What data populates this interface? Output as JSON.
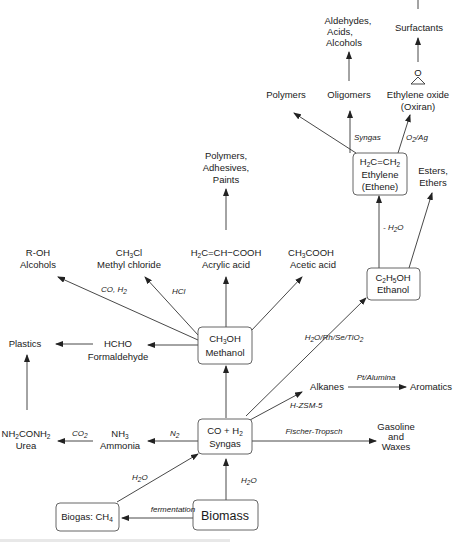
{
  "diagram": {
    "nodes": {
      "biomass": {
        "label": "Biomass"
      },
      "biogas": {
        "label": "Biogas: CH",
        "sub": "4"
      },
      "syngas": {
        "formula": "CO + H",
        "formula_sub": "2",
        "label": "Syngas"
      },
      "methanol": {
        "formula": "CH",
        "formula_sub": "3",
        "formula_rest": "OH",
        "label": "Methanol"
      },
      "ethanol": {
        "formula_a": "C",
        "sub_a": "2",
        "formula_b": "H",
        "sub_b": "5",
        "formula_rest": "OH",
        "label": "Ethanol"
      },
      "ethylene": {
        "formula_a": "H",
        "sub_a": "2",
        "formula_b": "C=CH",
        "sub_b": "2",
        "label": "Ethylene",
        "label2": "(Ethene)"
      },
      "ammonia": {
        "formula": "NH",
        "formula_sub": "3",
        "label": "Ammonia"
      },
      "urea": {
        "formula_a": "NH",
        "sub_a": "2",
        "formula_b": "CONH",
        "sub_b": "2",
        "label": "Urea"
      },
      "plastics": {
        "label": "Plastics"
      },
      "formaldehyde": {
        "formula": "HCHO",
        "label": "Formaldehyde"
      },
      "alcohols": {
        "formula": "R-OH",
        "label": "Alcohols"
      },
      "methyl_chloride": {
        "formula": "CH",
        "formula_sub": "3",
        "formula_rest": "Cl",
        "label": "Methyl chloride"
      },
      "acrylic_acid": {
        "formula_a": "H",
        "sub_a": "2",
        "formula_b": "C=CH−COOH",
        "label": "Acrylic acid"
      },
      "acetic_acid": {
        "formula": "CH",
        "formula_sub": "3",
        "formula_rest": "COOH",
        "label": "Acetic acid"
      },
      "polymers_adhesives": {
        "lines": [
          "Polymers,",
          "Adhesives,",
          "Paints"
        ]
      },
      "alkanes": {
        "label": "Alkanes"
      },
      "aromatics": {
        "label": "Aromatics"
      },
      "gasoline": {
        "lines": [
          "Gasoline",
          "and",
          "Waxes"
        ]
      },
      "esters": {
        "lines": [
          "Esters,",
          "Ethers"
        ]
      },
      "polymers": {
        "label": "Polymers"
      },
      "oligomers": {
        "label": "Oligomers"
      },
      "ethylene_oxide": {
        "label": "Ethylene oxide",
        "label2": "(Oxiran)",
        "ring_atom": "O"
      },
      "aldehydes": {
        "lines": [
          "Aldehydes,",
          "Acids,",
          "Alcohols"
        ]
      },
      "surfactants": {
        "label": "Surfactants"
      }
    },
    "conditions": {
      "fermentation": "fermentation",
      "biomass_syngas": {
        "a": "H",
        "sub": "2",
        "b": "O"
      },
      "biogas_syngas": {
        "a": "H",
        "sub": "2",
        "b": "O"
      },
      "n2": {
        "a": "N",
        "sub": "2"
      },
      "co2": {
        "a": "CO",
        "sub": "2"
      },
      "fischer": "Fischer-Tropsch",
      "hzsm": "H-ZSM-5",
      "pt": "Pt/Alumina",
      "rh": {
        "a": "H",
        "sub": "2",
        "b": "O/Rh/Se/TiO",
        "sub2": "2"
      },
      "hcl": "HCl",
      "co_h2": {
        "a": "CO, H",
        "sub": "2"
      },
      "dehydration": {
        "a": "- H",
        "sub": "2",
        "b": "O"
      },
      "syngas_oligo": "Syngas",
      "o2ag": {
        "a": "O",
        "sub": "2",
        "b": "/Ag"
      }
    }
  }
}
